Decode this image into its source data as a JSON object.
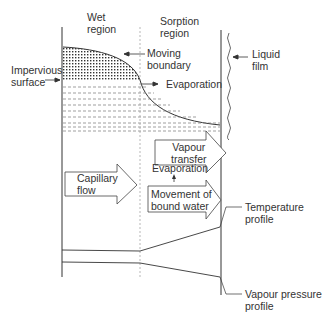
{
  "diagram": {
    "regions": {
      "wet": [
        "Wet",
        "region"
      ],
      "sorption": [
        "Sorption",
        "region"
      ]
    },
    "labels": {
      "impervious_surface": [
        "Impervious",
        "surface"
      ],
      "moving_boundary": [
        "Moving",
        "boundary"
      ],
      "evaporation_top": "Evaporation",
      "liquid_film": [
        "Liquid",
        "film"
      ],
      "vapour_transfer": [
        "Vapour",
        "transfer"
      ],
      "capillary_flow": [
        "Capillary",
        "flow"
      ],
      "evaporation_mid": "Evaporation",
      "movement_bound_water": [
        "Movement of",
        "bound water"
      ],
      "temperature_profile": [
        "Temperature",
        "profile"
      ],
      "vapour_pressure_profile": [
        "Vapour pressure",
        "profile"
      ]
    },
    "colors": {
      "line": "#333333",
      "dashed": "#888888",
      "background": "#ffffff"
    }
  }
}
